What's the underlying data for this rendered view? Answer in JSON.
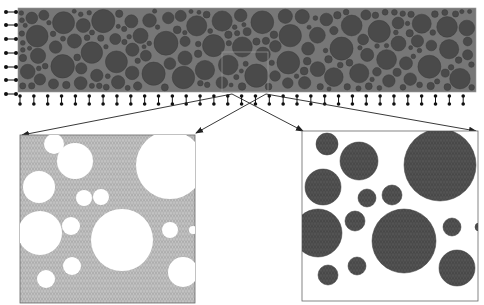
{
  "figure": {
    "colors": {
      "background": "#ffffff",
      "beam_matrix": "#777777",
      "aggregate": "#4a4a4a",
      "aggregate_edge": "#3a3a3a",
      "mortar_mesh_fill": "#a8a8a8",
      "mesh_line": "#d0d0d0",
      "aggregate_mesh_fill": "#474747",
      "support": "#111111",
      "arrow": "#222222",
      "panel_border": "#555555"
    }
  },
  "beam": {
    "x": 18,
    "y": 8,
    "width": 458,
    "height": 84,
    "sample_box": {
      "x": 222,
      "y": 52,
      "width": 46,
      "height": 40
    }
  },
  "supports": {
    "left": {
      "x": 6,
      "ys": [
        12,
        25,
        39,
        53,
        67,
        80,
        94
      ]
    },
    "bottom": {
      "y": 97,
      "x_start": 20,
      "x_end": 476,
      "spacing": 13.85
    }
  },
  "panels": {
    "mortar": {
      "label": "mortar-mesh-panel",
      "x": 20,
      "y": 135,
      "width": 175,
      "height": 168,
      "holes": [
        [
          54,
          144,
          10
        ],
        [
          75,
          161,
          18
        ],
        [
          39,
          187,
          16
        ],
        [
          84,
          198,
          8
        ],
        [
          101,
          197,
          8
        ],
        [
          40,
          233,
          22
        ],
        [
          71,
          226,
          9
        ],
        [
          122,
          240,
          31
        ],
        [
          170,
          165,
          34
        ],
        [
          170,
          230,
          8
        ],
        [
          72,
          266,
          9
        ],
        [
          46,
          279,
          9
        ],
        [
          183,
          272,
          15
        ],
        [
          193,
          230,
          4
        ]
      ]
    },
    "aggregate": {
      "label": "aggregate-mesh-panel",
      "x": 302,
      "y": 131,
      "width": 176,
      "height": 170,
      "circles": [
        [
          327,
          144,
          11
        ],
        [
          359,
          161,
          19
        ],
        [
          323,
          187,
          18
        ],
        [
          367,
          198,
          9
        ],
        [
          392,
          195,
          10
        ],
        [
          318,
          233,
          24
        ],
        [
          355,
          221,
          10
        ],
        [
          404,
          241,
          32
        ],
        [
          440,
          165,
          36
        ],
        [
          452,
          227,
          9
        ],
        [
          357,
          266,
          9
        ],
        [
          328,
          275,
          10
        ],
        [
          457,
          268,
          18
        ],
        [
          479,
          227,
          4
        ]
      ]
    }
  },
  "arrows": [
    {
      "from": [
        232,
        94
      ],
      "to": [
        22,
        135
      ]
    },
    {
      "from": [
        266,
        94
      ],
      "to": [
        196,
        133
      ]
    },
    {
      "from": [
        232,
        94
      ],
      "to": [
        303,
        131
      ]
    },
    {
      "from": [
        266,
        94
      ],
      "to": [
        476,
        131
      ]
    }
  ]
}
